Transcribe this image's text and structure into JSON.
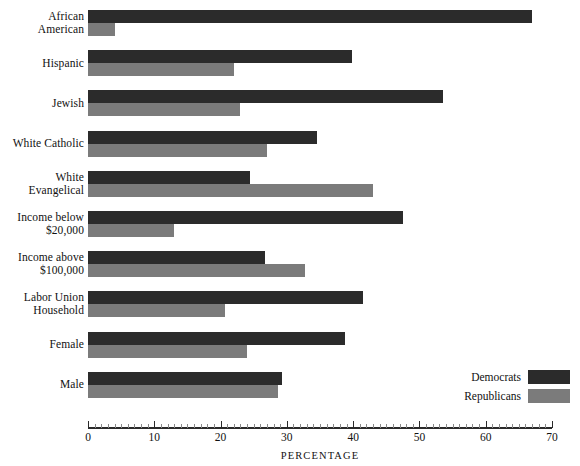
{
  "chart_data": {
    "type": "bar",
    "orientation": "horizontal",
    "title": "",
    "xlabel": "PERCENTAGE",
    "ylabel": "",
    "xlim": [
      0,
      70
    ],
    "xticks": [
      0,
      10,
      20,
      30,
      40,
      50,
      60,
      70
    ],
    "xtick_labels": [
      "0",
      "10",
      "20",
      "30",
      "40",
      "50",
      "60",
      "70"
    ],
    "minor_tick_step": 1,
    "grid": false,
    "legend_position": "bottom-right",
    "categories": [
      "African American",
      "Hispanic",
      "Jewish",
      "White Catholic",
      "White Evangelical",
      "Income below $20,000",
      "Income above $100,000",
      "Labor Union Household",
      "Female",
      "Male"
    ],
    "category_lines": [
      [
        "African",
        "American"
      ],
      [
        "Hispanic"
      ],
      [
        "Jewish"
      ],
      [
        "White Catholic"
      ],
      [
        "White",
        "Evangelical"
      ],
      [
        "Income below",
        "$20,000"
      ],
      [
        "Income above",
        "$100,000"
      ],
      [
        "Labor Union",
        "Household"
      ],
      [
        "Female"
      ],
      [
        "Male"
      ]
    ],
    "series": [
      {
        "name": "Democrats",
        "color": "#2b2b2b",
        "values": [
          67.0,
          39.8,
          53.5,
          34.5,
          24.5,
          47.5,
          26.7,
          41.5,
          38.7,
          29.2
        ]
      },
      {
        "name": "Republicans",
        "color": "#7b7b7b",
        "values": [
          4.0,
          22.0,
          23.0,
          27.0,
          43.0,
          13.0,
          32.7,
          20.7,
          24.0,
          28.7
        ]
      }
    ]
  },
  "legend": {
    "items": [
      {
        "label": "Democrats",
        "color": "#2b2b2b"
      },
      {
        "label": "Republicans",
        "color": "#7b7b7b"
      }
    ]
  },
  "axis": {
    "title": "PERCENTAGE"
  }
}
